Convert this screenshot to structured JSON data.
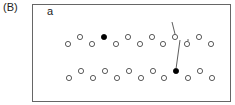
{
  "panel_label": "(B)",
  "sub_label": "a",
  "colors": {
    "stroke": "#333333",
    "filled": "#000000",
    "frame": "#666666"
  },
  "rows": [
    {
      "upper": [
        {
          "x": 80,
          "y": 37
        },
        {
          "x": 104,
          "y": 37,
          "filled": true
        },
        {
          "x": 128,
          "y": 37
        },
        {
          "x": 152,
          "y": 37
        },
        {
          "x": 175,
          "y": 37
        },
        {
          "x": 199,
          "y": 37
        }
      ],
      "lower": [
        {
          "x": 68,
          "y": 44
        },
        {
          "x": 92,
          "y": 44
        },
        {
          "x": 116,
          "y": 44
        },
        {
          "x": 140,
          "y": 44
        },
        {
          "x": 163,
          "y": 44
        },
        {
          "x": 187,
          "y": 44
        },
        {
          "x": 211,
          "y": 44
        }
      ]
    },
    {
      "upper": [
        {
          "x": 81,
          "y": 71
        },
        {
          "x": 105,
          "y": 71
        },
        {
          "x": 129,
          "y": 71
        },
        {
          "x": 153,
          "y": 71
        },
        {
          "x": 176,
          "y": 71,
          "filled": true
        },
        {
          "x": 200,
          "y": 71
        }
      ],
      "lower": [
        {
          "x": 69,
          "y": 78
        },
        {
          "x": 93,
          "y": 78
        },
        {
          "x": 117,
          "y": 78
        },
        {
          "x": 141,
          "y": 78
        },
        {
          "x": 164,
          "y": 78
        },
        {
          "x": 188,
          "y": 78
        },
        {
          "x": 212,
          "y": 78
        }
      ]
    }
  ],
  "lines": [
    {
      "x1": 172,
      "y1": 22,
      "x2": 175,
      "y2": 34
    },
    {
      "x1": 180,
      "y1": 40,
      "x2": 176,
      "y2": 69
    },
    {
      "x1": 188,
      "y1": 39,
      "x2": 188,
      "y2": 41
    }
  ]
}
